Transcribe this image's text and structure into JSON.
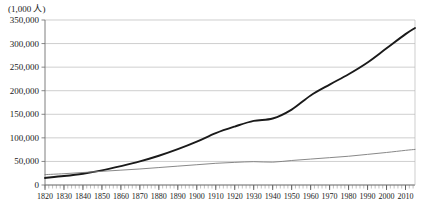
{
  "chart_data": {
    "type": "line",
    "title": "",
    "subtitle": "",
    "unit_note": "(1,000 人)",
    "xlabel": "",
    "ylabel": "",
    "xlim": [
      1820,
      2015
    ],
    "ylim": [
      0,
      350000
    ],
    "grid": true,
    "grid_axis": "y",
    "legend": "none",
    "y_ticks": [
      "0",
      "50,000",
      "100,000",
      "150,000",
      "200,000",
      "250,000",
      "300,000",
      "350,000"
    ],
    "y_tick_values": [
      0,
      50000,
      100000,
      150000,
      200000,
      250000,
      300000,
      350000
    ],
    "x_ticks": [
      "1820",
      "1830",
      "1840",
      "1850",
      "1860",
      "1870",
      "1880",
      "1890",
      "1900",
      "1910",
      "1920",
      "1930",
      "1940",
      "1950",
      "1960",
      "1970",
      "1980",
      "1990",
      "2000",
      "2010"
    ],
    "x_tick_values": [
      1820,
      1830,
      1840,
      1850,
      1860,
      1870,
      1880,
      1890,
      1900,
      1910,
      1920,
      1930,
      1940,
      1950,
      1960,
      1970,
      1980,
      1990,
      2000,
      2010
    ],
    "x_minor_tick_interval": 2,
    "series": [
      {
        "name": "thick-line",
        "style": "thick",
        "color": "#1a1a1a",
        "width": 1.9,
        "x": [
          1820,
          1830,
          1840,
          1850,
          1860,
          1870,
          1880,
          1890,
          1900,
          1910,
          1920,
          1930,
          1940,
          1950,
          1960,
          1970,
          1980,
          1990,
          2000,
          2010,
          2015
        ],
        "values": [
          15000,
          19000,
          24000,
          31000,
          40000,
          50000,
          62000,
          76000,
          92000,
          110000,
          124000,
          136000,
          141000,
          160000,
          190000,
          213000,
          235000,
          260000,
          290000,
          320000,
          333000
        ]
      },
      {
        "name": "thin-line",
        "style": "thin",
        "color": "#7a7a7a",
        "width": 0.9,
        "x": [
          1820,
          1830,
          1840,
          1850,
          1860,
          1870,
          1880,
          1890,
          1900,
          1910,
          1920,
          1930,
          1940,
          1950,
          1960,
          1970,
          1980,
          1990,
          2000,
          2010,
          2015
        ],
        "values": [
          22000,
          24000,
          26500,
          29000,
          31500,
          34000,
          37000,
          40000,
          43000,
          46000,
          48000,
          49500,
          48500,
          52000,
          55000,
          58000,
          61000,
          65000,
          69000,
          73500,
          75500
        ]
      }
    ]
  },
  "axes": {
    "plot_left": 45,
    "plot_right": 415,
    "plot_top": 20,
    "plot_bottom": 185
  }
}
